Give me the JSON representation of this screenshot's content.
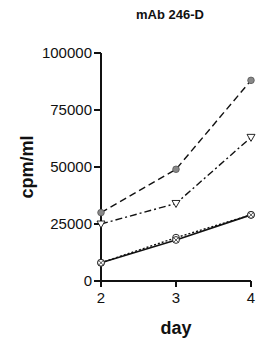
{
  "chart_data": {
    "type": "line",
    "title": "mAb 246-D",
    "xlabel": "day",
    "ylabel": "cpm/ml",
    "x": [
      2,
      3,
      4
    ],
    "x_ticks": [
      "2",
      "3",
      "4"
    ],
    "y_ticks": [
      "0",
      "25000",
      "50000",
      "75000",
      "100000"
    ],
    "ylim": [
      0,
      100000
    ],
    "xlim": [
      2,
      4
    ],
    "grid": false,
    "legend": "none",
    "series": [
      {
        "name": "filled circle (dashed)",
        "marker": "filled-circle",
        "line": "dashed",
        "values": [
          30000,
          49000,
          88000
        ]
      },
      {
        "name": "open triangle (dash-dot)",
        "marker": "open-triangle",
        "line": "dash-dot",
        "values": [
          25000,
          34000,
          63000
        ]
      },
      {
        "name": "open circle (dotted)",
        "marker": "open-circle",
        "line": "dotted",
        "values": [
          8000,
          19000,
          29000
        ]
      },
      {
        "name": "crossed circle (solid)",
        "marker": "crossed-circle",
        "line": "solid",
        "values": [
          8000,
          18000,
          29000
        ]
      }
    ]
  },
  "colors": {
    "ink": "#111111",
    "marker_fill": "#888888",
    "background": "#ffffff"
  }
}
